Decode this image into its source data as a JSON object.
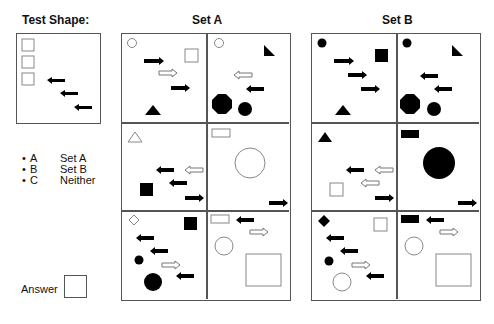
{
  "test_shape": {
    "title": "Test Shape:"
  },
  "set_a": {
    "title": "Set A"
  },
  "set_b": {
    "title": "Set B"
  },
  "options": [
    {
      "key": "A",
      "label": "Set A"
    },
    {
      "key": "B",
      "label": "Set B"
    },
    {
      "key": "C",
      "label": "Neither"
    }
  ],
  "answer": {
    "label": "Answer",
    "value": ""
  },
  "colors": {
    "border": "#555555",
    "fill": "#000000",
    "outline": "#888888"
  }
}
